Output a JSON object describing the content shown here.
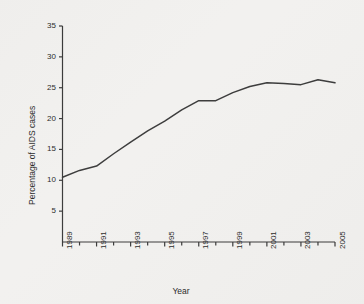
{
  "chart_data": {
    "type": "line",
    "title": "",
    "xlabel": "Year",
    "ylabel": "Percentage of AIDS cases",
    "xlim": [
      1989,
      2005
    ],
    "ylim": [
      0,
      35
    ],
    "grid": false,
    "legend": null,
    "x_ticks_major": [
      "1989",
      "1991",
      "1993",
      "1995",
      "1997",
      "1999",
      "2001",
      "2003",
      "2005"
    ],
    "x_ticks_minor": [
      "1990",
      "1992",
      "1994",
      "1996",
      "1998",
      "2000",
      "2002",
      "2004"
    ],
    "y_ticks": [
      "5",
      "10",
      "15",
      "20",
      "25",
      "30",
      "35"
    ],
    "line_color": "#3a3a3a",
    "background_color": "#f2f1ef",
    "x": [
      1989,
      1990,
      1991,
      1992,
      1993,
      1994,
      1995,
      1996,
      1997,
      1998,
      1999,
      2000,
      2001,
      2002,
      2003,
      2004,
      2005
    ],
    "values": [
      10.5,
      11.6,
      12.3,
      14.3,
      16.2,
      18.0,
      19.6,
      21.4,
      22.9,
      22.9,
      24.2,
      25.2,
      25.8,
      25.7,
      25.5,
      26.3,
      25.8
    ],
    "series": [
      {
        "name": "Percentage of AIDS cases",
        "values": [
          10.5,
          11.6,
          12.3,
          14.3,
          16.2,
          18.0,
          19.6,
          21.4,
          22.9,
          22.9,
          24.2,
          25.2,
          25.8,
          25.7,
          25.5,
          26.3,
          25.8
        ]
      }
    ]
  },
  "axes": {
    "y_title": "Percentage of AIDS cases",
    "x_title": "Year",
    "y_tick_labels": [
      "35",
      "30",
      "25",
      "20",
      "15",
      "10",
      "5"
    ],
    "x_tick_labels": [
      "1989",
      "1991",
      "1993",
      "1995",
      "1997",
      "1999",
      "2001",
      "2003",
      "2005"
    ]
  }
}
